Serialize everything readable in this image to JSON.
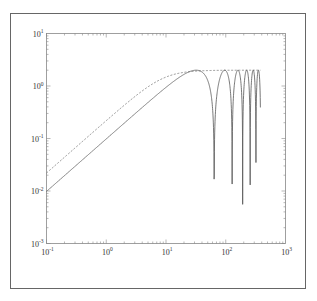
{
  "chart_data": {
    "type": "line",
    "title": "",
    "xlabel": "",
    "ylabel": "",
    "xscale": "log",
    "yscale": "log",
    "xlim": [
      0.1,
      1000
    ],
    "ylim": [
      0.001,
      10
    ],
    "grid": false,
    "legend": null,
    "x_tick_labels": [
      "10^-1",
      "10^0",
      "10^1",
      "10^2",
      "10^3"
    ],
    "y_tick_labels": [
      "10^-3",
      "10^-2",
      "10^-1",
      "10^0",
      "10^1"
    ],
    "x_ticks": [
      {
        "base": "10",
        "exp": "-1",
        "value": 0.1
      },
      {
        "base": "10",
        "exp": "0",
        "value": 1
      },
      {
        "base": "10",
        "exp": "1",
        "value": 10
      },
      {
        "base": "10",
        "exp": "2",
        "value": 100
      },
      {
        "base": "10",
        "exp": "3",
        "value": 1000
      }
    ],
    "y_ticks": [
      {
        "base": "10",
        "exp": "-3",
        "value": 0.001
      },
      {
        "base": "10",
        "exp": "-2",
        "value": 0.01
      },
      {
        "base": "10",
        "exp": "-1",
        "value": 0.1
      },
      {
        "base": "10",
        "exp": "0",
        "value": 1
      },
      {
        "base": "10",
        "exp": "1",
        "value": 10
      }
    ],
    "series": [
      {
        "name": "magnitude response",
        "style": "solid",
        "color": "#555555",
        "description": "Rises with slope 1 (|H| ≈ 0.1·f) from 0.01 at f=0.1, peaks at 2 near f≈32, then shows comb notches at f≈64, 128, 192, 256, 320; curve ends near f≈380",
        "x": [
          0.1,
          1,
          10,
          20,
          32,
          45,
          64,
          90,
          110,
          128,
          150,
          170,
          192,
          215,
          235,
          256,
          280,
          300,
          320,
          350,
          380
        ],
        "y": [
          0.01,
          0.098,
          0.94,
          1.66,
          2.0,
          1.66,
          0.0015,
          1.57,
          1.93,
          0.012,
          1.11,
          1.96,
          0.015,
          1.61,
          1.9,
          0.055,
          1.61,
          1.9,
          0.04,
          1.4,
          2.0
        ]
      },
      {
        "name": "envelope",
        "style": "dashed",
        "color": "#777777",
        "description": "Upper envelope: rises with slope 1 from ≈0.022 at f=0.1, smoothly saturates to 2 near f≈20 and stays flat to f≈380",
        "x": [
          0.1,
          1,
          5,
          10,
          20,
          32,
          100,
          380
        ],
        "y": [
          0.022,
          0.22,
          1.03,
          1.48,
          1.82,
          2.0,
          2.0,
          2.0
        ]
      }
    ],
    "notch_frequencies": [
      64,
      128,
      192,
      256,
      320
    ],
    "peak": {
      "x": 32,
      "y": 2.0
    }
  }
}
